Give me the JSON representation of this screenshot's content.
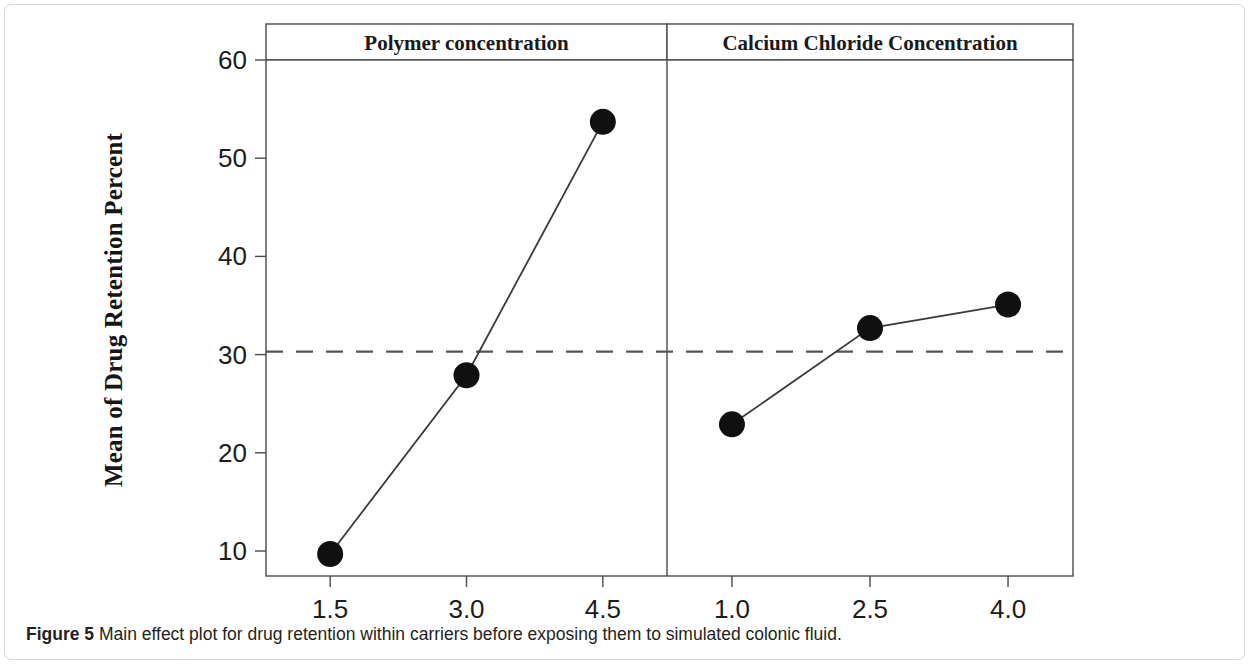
{
  "figure": {
    "caption_label": "Figure 5",
    "caption_text": "Main effect plot for drug retention within carriers before exposing them to simulated colonic fluid."
  },
  "chart_data": {
    "type": "line",
    "title": "",
    "subtitle": "",
    "xlabel": "",
    "ylabel": "Mean of Drug Retention Percent",
    "ylim": [
      5,
      61
    ],
    "yticks": [
      10,
      20,
      30,
      40,
      50,
      60
    ],
    "ytick_labels": [
      "10",
      "20",
      "30",
      "40",
      "50",
      "60"
    ],
    "grid": false,
    "legend": "none",
    "reference_line": {
      "label": "grand mean",
      "value": 30.3,
      "style": "dashed",
      "color": "#555555"
    },
    "marker": {
      "shape": "circle",
      "color": "#101010",
      "size": 13
    },
    "line_color": "#3a3a3a",
    "panels": [
      {
        "title": "Polymer concentration",
        "categories": [
          "1.5",
          "3.0",
          "4.5"
        ],
        "values": [
          9.7,
          27.9,
          53.7
        ]
      },
      {
        "title": "Calcium Chloride Concentration",
        "categories": [
          "1.0",
          "2.5",
          "4.0"
        ],
        "values": [
          22.9,
          32.7,
          35.1
        ]
      }
    ]
  }
}
